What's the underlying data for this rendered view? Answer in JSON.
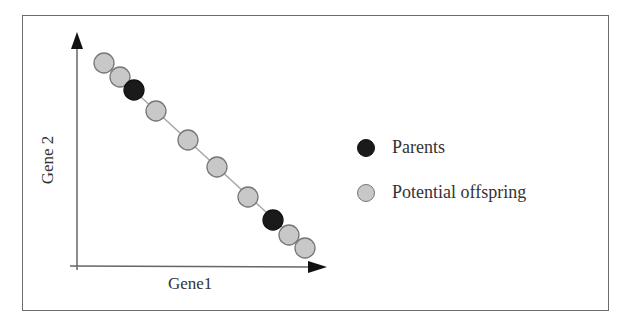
{
  "chart_data": {
    "type": "scatter",
    "title": "",
    "xlabel": "Gene1",
    "ylabel": "Gene 2",
    "grid": false,
    "legend_position": "right",
    "legend": [
      {
        "label": "Parents",
        "color": "#1a1a1a",
        "stroke": "#111111"
      },
      {
        "label": "Potential offspring",
        "color": "#c8c8c8",
        "stroke": "#777777"
      }
    ],
    "line": {
      "from": [
        104,
        63
      ],
      "to": [
        305,
        248
      ],
      "color": "#a8a8a8"
    },
    "points": [
      {
        "x": 104,
        "y": 63,
        "series": "Potential offspring"
      },
      {
        "x": 120,
        "y": 77,
        "series": "Potential offspring"
      },
      {
        "x": 134,
        "y": 90,
        "series": "Parents"
      },
      {
        "x": 156,
        "y": 111,
        "series": "Potential offspring"
      },
      {
        "x": 188,
        "y": 140,
        "series": "Potential offspring"
      },
      {
        "x": 217,
        "y": 167,
        "series": "Potential offspring"
      },
      {
        "x": 248,
        "y": 197,
        "series": "Potential offspring"
      },
      {
        "x": 273,
        "y": 220,
        "series": "Parents"
      },
      {
        "x": 289,
        "y": 235,
        "series": "Potential offspring"
      },
      {
        "x": 305,
        "y": 248,
        "series": "Potential offspring"
      }
    ],
    "axes": {
      "origin": [
        76,
        266
      ],
      "y_arrow_tip": [
        77,
        32
      ],
      "x_arrow_tip": [
        327,
        267
      ]
    }
  },
  "labels": {
    "xlabel": "Gene1",
    "ylabel": "Gene 2",
    "legend_parents": "Parents",
    "legend_offspring": "Potential offspring"
  }
}
